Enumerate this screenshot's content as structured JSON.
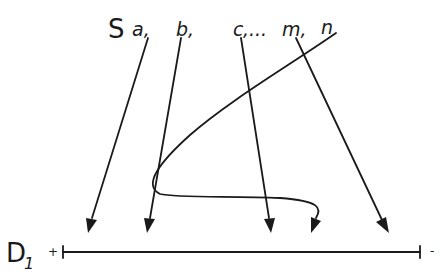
{
  "figure": {
    "header_text": "",
    "source": {
      "symbol": "S",
      "labels": [
        "a,",
        "b,",
        "c",
        ",...",
        "m,",
        "n"
      ]
    },
    "target": {
      "symbol": "D",
      "subscript": "1",
      "plus": "+",
      "minus": "-"
    },
    "arrows": [
      {
        "name": "a",
        "from": [
          148,
          38
        ],
        "to": [
          88,
          232
        ]
      },
      {
        "name": "b",
        "from": [
          181,
          38
        ],
        "to": [
          147,
          232
        ]
      },
      {
        "name": "c",
        "from": [
          241,
          38
        ],
        "to": [
          271,
          232
        ]
      },
      {
        "name": "m",
        "from": [
          296,
          38
        ],
        "to": [
          388,
          232
        ]
      },
      {
        "name": "n",
        "type": "curve",
        "from": [
          336,
          33
        ],
        "to": [
          311,
          232
        ]
      }
    ],
    "colors": {
      "ink": "#1a1a1a",
      "background": "#ffffff"
    }
  }
}
